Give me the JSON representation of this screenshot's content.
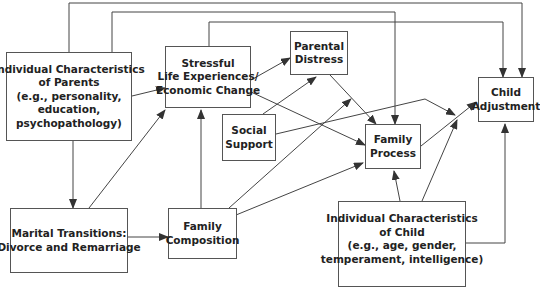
{
  "diagram": {
    "nodes": {
      "parents": {
        "lines": [
          "Individual Characteristics",
          "of Parents",
          "(e.g., personality,",
          "education,",
          "psychopathology)"
        ]
      },
      "stressful": {
        "lines": [
          "Stressful",
          "Life Experiences/",
          "Economic Change"
        ]
      },
      "parental_distress": {
        "lines": [
          "Parental",
          "Distress"
        ]
      },
      "social_support": {
        "lines": [
          "Social",
          "Support"
        ]
      },
      "family_process": {
        "lines": [
          "Family",
          "Process"
        ]
      },
      "child_adjustment": {
        "lines": [
          "Child",
          "Adjustment"
        ]
      },
      "marital": {
        "lines": [
          "Marital Transitions:",
          "Divorce and Remarriage"
        ]
      },
      "family_composition": {
        "lines": [
          "Family",
          "Composition"
        ]
      },
      "child_characteristics": {
        "lines": [
          "Individual Characteristics",
          "of Child",
          "(e.g., age, gender,",
          "temperament, intelligence)"
        ]
      }
    },
    "edges": [
      {
        "from": "parents",
        "to": "child_adjustment"
      },
      {
        "from": "parents",
        "to": "family_process"
      },
      {
        "from": "stressful",
        "to": "child_adjustment"
      },
      {
        "from": "parents",
        "to": "stressful"
      },
      {
        "from": "parents",
        "to": "marital"
      },
      {
        "from": "stressful",
        "to": "parental_distress"
      },
      {
        "from": "stressful",
        "to": "family_process"
      },
      {
        "from": "parental_distress",
        "to": "family_process"
      },
      {
        "from": "social_support",
        "to": "parental_distress"
      },
      {
        "from": "social_support",
        "to": "child_adjustment"
      },
      {
        "from": "marital",
        "to": "stressful"
      },
      {
        "from": "marital",
        "to": "family_composition"
      },
      {
        "from": "family_composition",
        "to": "stressful"
      },
      {
        "from": "family_composition",
        "to": "parental_distress"
      },
      {
        "from": "family_composition",
        "to": "family_process"
      },
      {
        "from": "family_process",
        "to": "child_adjustment"
      },
      {
        "from": "child_characteristics",
        "to": "family_process"
      },
      {
        "from": "child_characteristics",
        "to": "child_adjustment"
      },
      {
        "from": "child_characteristics",
        "to": "child_adjustment_direct"
      }
    ],
    "colors": {
      "line": "#444444",
      "text": "#222222",
      "border": "#555555"
    }
  }
}
